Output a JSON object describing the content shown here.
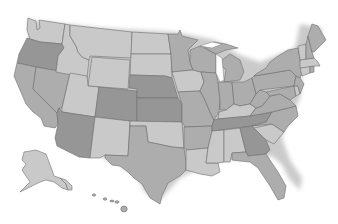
{
  "map": {
    "title": "United States",
    "type": "choropleth-grayscale",
    "colors": {
      "light": "#c9c9c9",
      "medium": "#adadad",
      "dark": "#969696",
      "border": "#6e6e6e",
      "background": "#ffffff",
      "shadow": "#9a9a9a"
    },
    "states": [
      {
        "name": "Washington",
        "shade": "light"
      },
      {
        "name": "Oregon",
        "shade": "dark"
      },
      {
        "name": "California",
        "shade": "medium"
      },
      {
        "name": "Idaho",
        "shade": "light"
      },
      {
        "name": "Nevada",
        "shade": "medium"
      },
      {
        "name": "Montana",
        "shade": "light"
      },
      {
        "name": "Wyoming",
        "shade": "light"
      },
      {
        "name": "Utah",
        "shade": "light"
      },
      {
        "name": "Arizona",
        "shade": "dark"
      },
      {
        "name": "Colorado",
        "shade": "dark"
      },
      {
        "name": "New Mexico",
        "shade": "light"
      },
      {
        "name": "North Dakota",
        "shade": "light"
      },
      {
        "name": "South Dakota",
        "shade": "light"
      },
      {
        "name": "Nebraska",
        "shade": "dark"
      },
      {
        "name": "Kansas",
        "shade": "dark"
      },
      {
        "name": "Oklahoma",
        "shade": "light"
      },
      {
        "name": "Texas",
        "shade": "medium"
      },
      {
        "name": "Minnesota",
        "shade": "medium"
      },
      {
        "name": "Iowa",
        "shade": "light"
      },
      {
        "name": "Missouri",
        "shade": "medium"
      },
      {
        "name": "Arkansas",
        "shade": "medium"
      },
      {
        "name": "Louisiana",
        "shade": "light"
      },
      {
        "name": "Wisconsin",
        "shade": "medium"
      },
      {
        "name": "Illinois",
        "shade": "medium"
      },
      {
        "name": "Michigan",
        "shade": "medium"
      },
      {
        "name": "Indiana",
        "shade": "medium"
      },
      {
        "name": "Ohio",
        "shade": "medium"
      },
      {
        "name": "Kentucky",
        "shade": "light"
      },
      {
        "name": "Tennessee",
        "shade": "dark"
      },
      {
        "name": "Mississippi",
        "shade": "light"
      },
      {
        "name": "Alabama",
        "shade": "light"
      },
      {
        "name": "Georgia",
        "shade": "dark"
      },
      {
        "name": "Florida",
        "shade": "medium"
      },
      {
        "name": "South Carolina",
        "shade": "light"
      },
      {
        "name": "North Carolina",
        "shade": "medium"
      },
      {
        "name": "Virginia",
        "shade": "medium"
      },
      {
        "name": "West Virginia",
        "shade": "medium"
      },
      {
        "name": "Pennsylvania",
        "shade": "medium"
      },
      {
        "name": "New York",
        "shade": "medium"
      },
      {
        "name": "Maryland",
        "shade": "medium"
      },
      {
        "name": "Delaware",
        "shade": "light"
      },
      {
        "name": "New Jersey",
        "shade": "medium"
      },
      {
        "name": "Connecticut",
        "shade": "light"
      },
      {
        "name": "Rhode Island",
        "shade": "medium"
      },
      {
        "name": "Massachusetts",
        "shade": "light"
      },
      {
        "name": "Vermont",
        "shade": "light"
      },
      {
        "name": "New Hampshire",
        "shade": "medium"
      },
      {
        "name": "Maine",
        "shade": "medium"
      },
      {
        "name": "Alaska",
        "shade": "light"
      },
      {
        "name": "Hawaii",
        "shade": "medium"
      }
    ]
  }
}
